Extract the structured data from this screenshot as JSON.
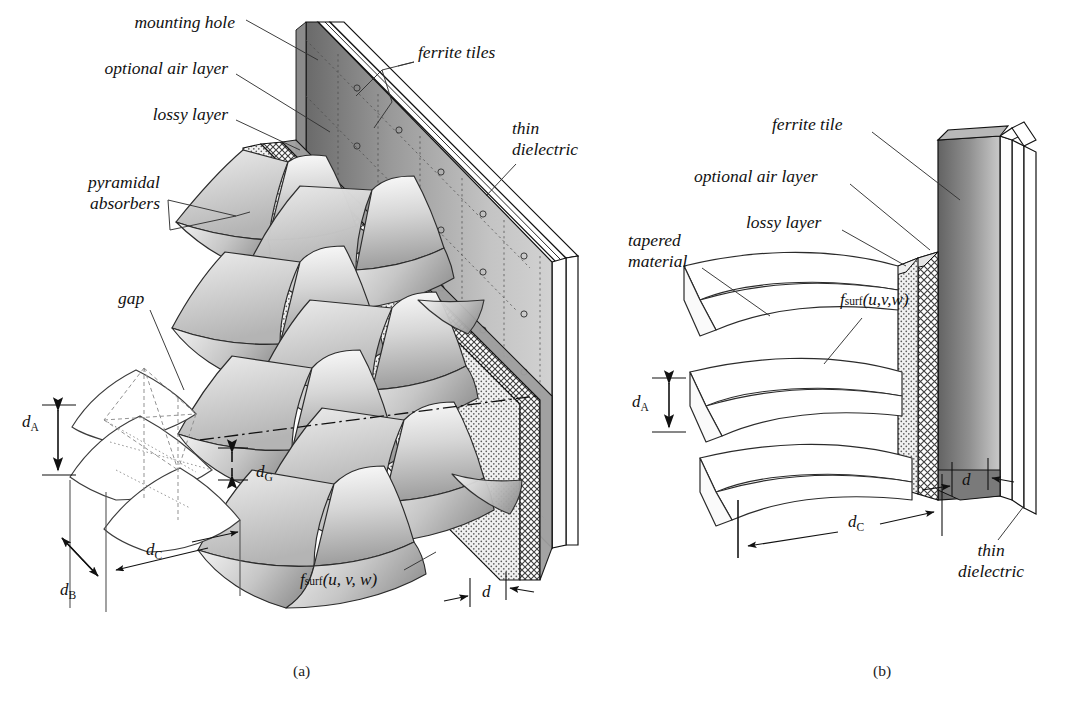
{
  "figure": {
    "type": "technical-line-diagram",
    "background": "#ffffff",
    "ink": "#111111"
  },
  "panels": [
    {
      "id": "a",
      "caption": "(a)",
      "caption_x": 293,
      "caption_y": 662,
      "description": "3D cut-away view of a chamber wall: staggered array of pyramidal absorbers in front of a lossy layer, optional air layer, ferrite-tile wall and thin dielectric backing.",
      "labels": [
        {
          "name": "mounting-hole",
          "text": "mounting hole",
          "x": 235,
          "y": 14,
          "align": "right"
        },
        {
          "name": "optional-air-layer",
          "text": "optional air layer",
          "x": 228,
          "y": 68,
          "align": "right"
        },
        {
          "name": "lossy-layer",
          "text": "lossy layer",
          "x": 228,
          "y": 114,
          "align": "right"
        },
        {
          "name": "pyramidal-absorbers",
          "text": "pyramidal\nabsorbers",
          "x": 160,
          "y": 182,
          "align": "right"
        },
        {
          "name": "ferrite-tiles",
          "text": "ferrite tiles",
          "x": 418,
          "y": 52,
          "align": "left"
        },
        {
          "name": "thin-dielectric",
          "text": "thin\ndielectric",
          "x": 516,
          "y": 128,
          "align": "left"
        },
        {
          "name": "gap",
          "text": "gap",
          "x": 120,
          "y": 297,
          "align": "left"
        }
      ],
      "dimensions": [
        {
          "name": "d-A",
          "symbol": "d",
          "subscript": "A",
          "x": 24,
          "y": 424
        },
        {
          "name": "d-G",
          "symbol": "d",
          "subscript": "G",
          "x": 248,
          "y": 474
        },
        {
          "name": "d-B",
          "symbol": "d",
          "subscript": "B",
          "x": 64,
          "y": 582
        },
        {
          "name": "d-C",
          "symbol": "d",
          "subscript": "C",
          "x": 148,
          "y": 548
        },
        {
          "name": "d-thickness",
          "symbol": "d",
          "subscript": "",
          "x": 486,
          "y": 592
        }
      ],
      "formula": {
        "name": "f-surf-a",
        "text": "f_surf(u, v, w)",
        "base": "f",
        "sub": "surf",
        "args": "(u, v, w)",
        "x": 302,
        "y": 578
      }
    },
    {
      "id": "b",
      "caption": "(b)",
      "caption_x": 873,
      "caption_y": 662,
      "description": "2D cross-sectional / detail view of a single tapered absorber wedge stack against the lossy layer, optional air layer, ferrite tile and thin dielectric.",
      "labels": [
        {
          "name": "ferrite-tile",
          "text": "ferrite tile",
          "x": 775,
          "y": 124,
          "align": "left"
        },
        {
          "name": "optional-air-layer",
          "text": "optional air layer",
          "x": 696,
          "y": 176,
          "align": "left"
        },
        {
          "name": "lossy-layer",
          "text": "lossy layer",
          "x": 748,
          "y": 222,
          "align": "left"
        },
        {
          "name": "tapered-material",
          "text": "tapered\nmaterial",
          "x": 630,
          "y": 240,
          "align": "left"
        },
        {
          "name": "thin-dielectric",
          "text": "thin\ndielectric",
          "x": 975,
          "y": 548,
          "align": "left"
        }
      ],
      "dimensions": [
        {
          "name": "d-A",
          "symbol": "d",
          "subscript": "A",
          "x": 636,
          "y": 400
        },
        {
          "name": "d-C",
          "symbol": "d",
          "subscript": "C",
          "x": 852,
          "y": 520
        },
        {
          "name": "d-thickness",
          "symbol": "d",
          "subscript": "",
          "x": 966,
          "y": 480
        }
      ],
      "formula": {
        "name": "f-surf-b",
        "text": "f_surf(u, v, w)",
        "base": "f",
        "sub": "surf",
        "args": "(u,v,w)",
        "x": 842,
        "y": 300
      }
    }
  ],
  "layers": {
    "lossy_layer_fill": "#d9d9d9",
    "air_layer_fill": "#ebebeb",
    "ferrite_dark": "#6e6e6e",
    "ferrite_light": "#cfcfcf",
    "absorber_light": "#f2f2f2",
    "absorber_mid": "#b9b9b9",
    "absorber_dark": "#8d8d8d",
    "dielectric_fill": "#ffffff"
  }
}
